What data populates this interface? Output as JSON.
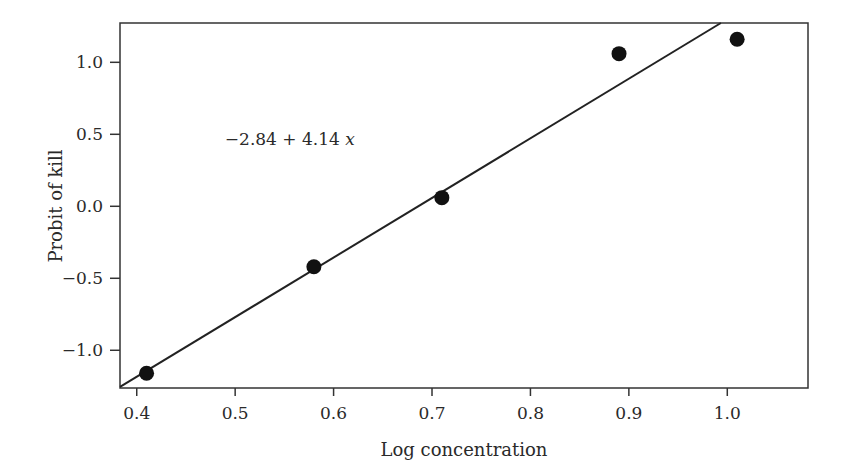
{
  "chart_data": {
    "type": "scatter",
    "title": "",
    "xlabel": "Log concentration",
    "ylabel": "Probit of kill",
    "xlim": [
      0.383,
      1.082
    ],
    "ylim": [
      -1.262,
      1.273
    ],
    "xticks": [
      0.4,
      0.5,
      0.6,
      0.7,
      0.8,
      0.9,
      1.0
    ],
    "xtick_labels": [
      "0.4",
      "0.5",
      "0.6",
      "0.7",
      "0.8",
      "0.9",
      "1.0"
    ],
    "yticks": [
      1.0,
      0.5,
      0.0,
      -0.5,
      -1.0
    ],
    "ytick_labels": [
      "1.0",
      "0.5",
      "0.0",
      "−0.5",
      "−1.0"
    ],
    "grid": false,
    "legend": null,
    "series": [
      {
        "name": "Observed",
        "marker": "filled-circle",
        "x": [
          0.41,
          0.58,
          0.71,
          0.89,
          1.01
        ],
        "y": [
          -1.16,
          -0.42,
          0.06,
          1.06,
          1.16
        ]
      }
    ],
    "fit_line": {
      "intercept": -2.84,
      "slope": 4.14,
      "label": "−2.84 + 4.14 x"
    },
    "annotations": [
      {
        "text": "−2.84 + 4.14 x",
        "x": 0.52,
        "y": 0.47
      }
    ]
  }
}
